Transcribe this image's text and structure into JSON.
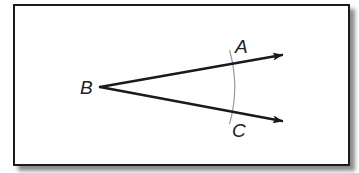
{
  "figure": {
    "colors": {
      "frame": "#1a1a1a",
      "ray": "#1a1a1a",
      "arc": "#9a9a9a",
      "label": "#222222",
      "background": "#ffffff"
    },
    "points": {
      "vertex": {
        "label": "B",
        "x": 100,
        "y": 87
      },
      "A": {
        "label": "A",
        "x": 280,
        "y": 55
      },
      "C": {
        "label": "C",
        "x": 280,
        "y": 120
      }
    },
    "rays": [
      {
        "name": "ray-BA",
        "from": "B",
        "to": "A"
      },
      {
        "name": "ray-BC",
        "from": "B",
        "to": "C"
      }
    ],
    "arc": {
      "description": "compass arc crossing both rays",
      "center_x": 100,
      "center_y": 87
    }
  }
}
